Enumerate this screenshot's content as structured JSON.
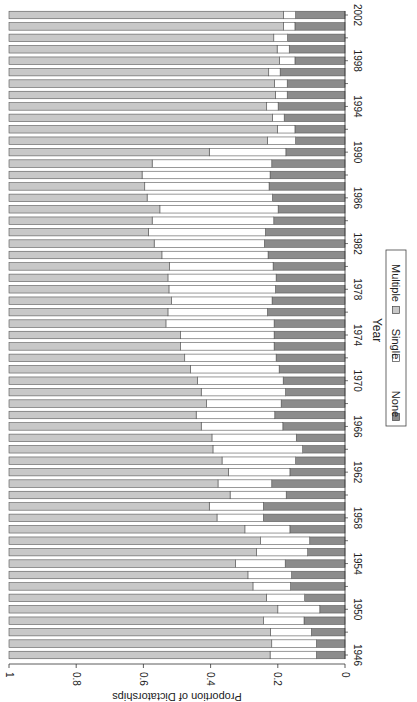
{
  "chart_data": {
    "type": "bar",
    "stacked": true,
    "orientation": "rotated-90-clockwise",
    "title": "",
    "xlabel": "Year",
    "ylabel": "Proportion of Dictatorships",
    "ylim": [
      0,
      1
    ],
    "y_ticks": [
      "0",
      "0.2",
      "0.4",
      "0.6",
      "0.8",
      "1"
    ],
    "x_tick_labels": [
      "1946",
      "1950",
      "1954",
      "1958",
      "1962",
      "1966",
      "1970",
      "1974",
      "1978",
      "1982",
      "1986",
      "1990",
      "1994",
      "1998",
      "2002"
    ],
    "grid": false,
    "legend_position": "bottom",
    "categories": [
      1946,
      1947,
      1948,
      1949,
      1950,
      1951,
      1952,
      1953,
      1954,
      1955,
      1956,
      1957,
      1958,
      1959,
      1960,
      1961,
      1962,
      1963,
      1964,
      1965,
      1966,
      1967,
      1968,
      1969,
      1970,
      1971,
      1972,
      1973,
      1974,
      1975,
      1976,
      1977,
      1978,
      1979,
      1980,
      1981,
      1982,
      1983,
      1984,
      1985,
      1986,
      1987,
      1988,
      1989,
      1990,
      1991,
      1992,
      1993,
      1994,
      1995,
      1996,
      1997,
      1998,
      1999,
      2000,
      2001,
      2002
    ],
    "series": [
      {
        "name": "None",
        "color": "#8c8c8c",
        "values": [
          0.085,
          0.085,
          0.1,
          0.122,
          0.075,
          0.12,
          0.162,
          0.159,
          0.178,
          0.111,
          0.105,
          0.164,
          0.243,
          0.243,
          0.175,
          0.218,
          0.164,
          0.147,
          0.126,
          0.145,
          0.185,
          0.209,
          0.19,
          0.177,
          0.184,
          0.196,
          0.205,
          0.211,
          0.211,
          0.211,
          0.231,
          0.217,
          0.207,
          0.205,
          0.214,
          0.229,
          0.24,
          0.237,
          0.212,
          0.199,
          0.216,
          0.226,
          0.223,
          0.218,
          0.176,
          0.147,
          0.149,
          0.181,
          0.199,
          0.172,
          0.172,
          0.193,
          0.149,
          0.166,
          0.171,
          0.149,
          0.147
        ]
      },
      {
        "name": "Single",
        "color": "#ffffff",
        "values": [
          0.138,
          0.133,
          0.122,
          0.12,
          0.125,
          0.114,
          0.112,
          0.13,
          0.148,
          0.152,
          0.146,
          0.134,
          0.138,
          0.161,
          0.167,
          0.16,
          0.183,
          0.219,
          0.267,
          0.251,
          0.243,
          0.234,
          0.222,
          0.251,
          0.255,
          0.264,
          0.272,
          0.278,
          0.278,
          0.322,
          0.296,
          0.299,
          0.317,
          0.322,
          0.308,
          0.316,
          0.328,
          0.348,
          0.362,
          0.352,
          0.373,
          0.37,
          0.381,
          0.356,
          0.228,
          0.084,
          0.052,
          0.035,
          0.034,
          0.035,
          0.038,
          0.034,
          0.046,
          0.036,
          0.041,
          0.034,
          0.036
        ]
      },
      {
        "name": "Multiple",
        "color": "#c8c8c8",
        "values": [
          0.777,
          0.782,
          0.778,
          0.758,
          0.8,
          0.766,
          0.726,
          0.711,
          0.674,
          0.737,
          0.749,
          0.702,
          0.619,
          0.596,
          0.658,
          0.622,
          0.653,
          0.634,
          0.607,
          0.604,
          0.572,
          0.557,
          0.588,
          0.572,
          0.561,
          0.54,
          0.523,
          0.511,
          0.511,
          0.467,
          0.473,
          0.484,
          0.476,
          0.473,
          0.478,
          0.455,
          0.432,
          0.415,
          0.426,
          0.449,
          0.411,
          0.404,
          0.396,
          0.426,
          0.596,
          0.769,
          0.799,
          0.784,
          0.767,
          0.793,
          0.79,
          0.773,
          0.805,
          0.798,
          0.788,
          0.817,
          0.817
        ]
      }
    ]
  },
  "legend": {
    "items": [
      {
        "label": "None",
        "color": "#8c8c8c"
      },
      {
        "label": "Single",
        "color": "#ffffff"
      },
      {
        "label": "Multiple",
        "color": "#c8c8c8"
      }
    ]
  },
  "axes": {
    "xlabel": "Year",
    "ylabel": "Proportion of Dictatorships"
  }
}
